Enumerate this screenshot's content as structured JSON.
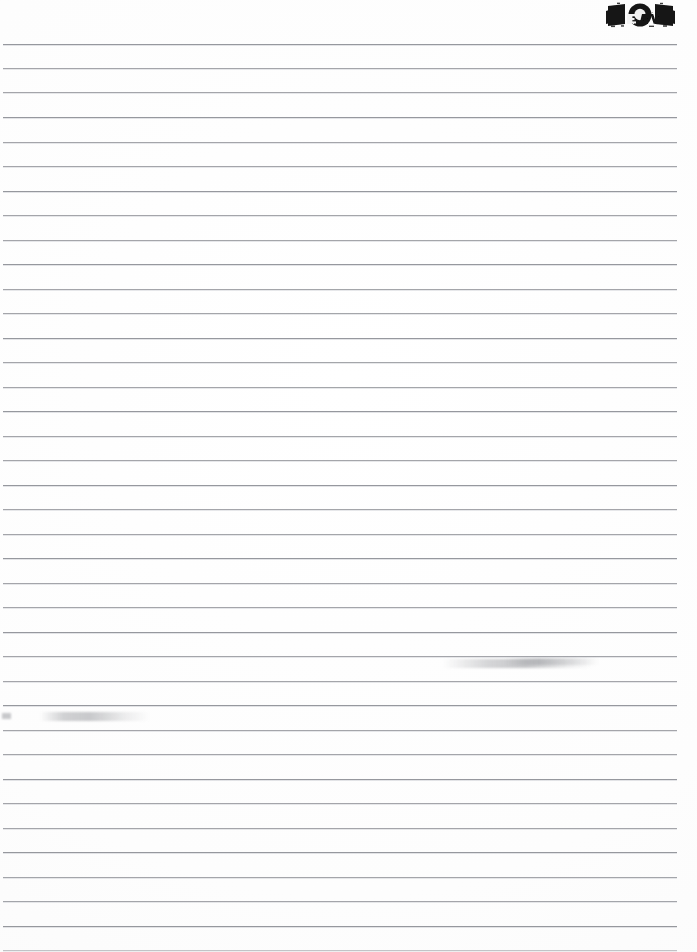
{
  "document": {
    "kind": "scanned-ruled-page",
    "width_px": 697,
    "height_px": 952,
    "paper_color": "#fefefe",
    "rule_color": "#8e9096",
    "ink_color": "#111111"
  },
  "header": {
    "page_number": "101",
    "stamp_overlay_text": "DR",
    "stamp_description": "page-number-stamp"
  },
  "body": {
    "content_text": "",
    "is_blank": true,
    "rule_count": 37,
    "rule_spacing_px": 24.6,
    "first_rule_y_px": 44,
    "rule_left_px": 3,
    "rule_right_px": 677
  },
  "rules": [
    {
      "y": 44,
      "weight": "strong"
    },
    {
      "y": 68,
      "weight": "normal"
    },
    {
      "y": 92,
      "weight": "normal"
    },
    {
      "y": 117,
      "weight": "strong"
    },
    {
      "y": 142,
      "weight": "normal"
    },
    {
      "y": 166,
      "weight": "normal"
    },
    {
      "y": 191,
      "weight": "strong"
    },
    {
      "y": 215,
      "weight": "normal"
    },
    {
      "y": 240,
      "weight": "normal"
    },
    {
      "y": 264,
      "weight": "strong"
    },
    {
      "y": 289,
      "weight": "normal"
    },
    {
      "y": 313,
      "weight": "normal"
    },
    {
      "y": 338,
      "weight": "strong"
    },
    {
      "y": 362,
      "weight": "normal"
    },
    {
      "y": 387,
      "weight": "normal"
    },
    {
      "y": 411,
      "weight": "strong"
    },
    {
      "y": 436,
      "weight": "normal"
    },
    {
      "y": 460,
      "weight": "normal"
    },
    {
      "y": 485,
      "weight": "strong"
    },
    {
      "y": 509,
      "weight": "normal"
    },
    {
      "y": 534,
      "weight": "normal"
    },
    {
      "y": 558,
      "weight": "strong"
    },
    {
      "y": 583,
      "weight": "normal"
    },
    {
      "y": 607,
      "weight": "normal"
    },
    {
      "y": 632,
      "weight": "strong"
    },
    {
      "y": 656,
      "weight": "normal"
    },
    {
      "y": 681,
      "weight": "normal"
    },
    {
      "y": 705,
      "weight": "strong"
    },
    {
      "y": 730,
      "weight": "normal"
    },
    {
      "y": 754,
      "weight": "normal"
    },
    {
      "y": 779,
      "weight": "strong"
    },
    {
      "y": 803,
      "weight": "normal"
    },
    {
      "y": 828,
      "weight": "normal"
    },
    {
      "y": 852,
      "weight": "strong"
    },
    {
      "y": 877,
      "weight": "normal"
    },
    {
      "y": 901,
      "weight": "normal"
    },
    {
      "y": 926,
      "weight": "strong"
    },
    {
      "y": 950,
      "weight": "faint"
    }
  ],
  "artifacts": [
    {
      "name": "smudge-right",
      "x": 443,
      "y": 659,
      "note": "faint ink smear on rule"
    },
    {
      "name": "smudge-right-tail",
      "x": 505,
      "y": 658,
      "note": "faint ink smear continuation"
    },
    {
      "name": "smudge-left",
      "x": 40,
      "y": 712,
      "note": "faint ink smear on rule"
    },
    {
      "name": "smudge-left-dot",
      "x": 2,
      "y": 713,
      "note": "small edge speck"
    }
  ]
}
